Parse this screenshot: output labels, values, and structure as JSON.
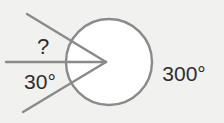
{
  "diagram": {
    "colors": {
      "background": "#f1f1f0",
      "circle_fill": "#ffffff",
      "stroke": "#8a8a8a",
      "text": "#2e2e2e"
    },
    "labels": {
      "unknown_angle": "?",
      "known_angle": "30°",
      "reflex_angle": "300°"
    },
    "angles": {
      "reflex_deg": 300,
      "known_deg": 30,
      "unknown": "?"
    }
  }
}
